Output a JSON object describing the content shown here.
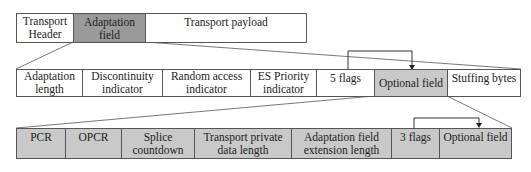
{
  "top_row": {
    "transport_header": "Transport Header",
    "adaptation_field": "Adaptation field",
    "transport_payload": "Transport payload"
  },
  "adaptation_row": {
    "adaptation_length": "Adaptation length",
    "discontinuity_indicator": "Discontinuity indicator",
    "random_access_indicator": "Random access indicator",
    "es_priority_indicator": "ES Priority indicator",
    "five_flags": "5 flags",
    "optional_field": "Optional field",
    "stuffing_bytes": "Stuffing bytes"
  },
  "optional_row": {
    "pcr": "PCR",
    "opcr": "OPCR",
    "splice_countdown": "Splice countdown",
    "transport_private_data_length": "Transport private data length",
    "adaptation_field_extension_length": "Adaptation field extension length",
    "three_flags": "3 flags",
    "optional_field": "Optional field"
  },
  "colors": {
    "highlight_dark": "#9a9a9a",
    "highlight_light": "#c9c9c9",
    "border": "#555555"
  }
}
